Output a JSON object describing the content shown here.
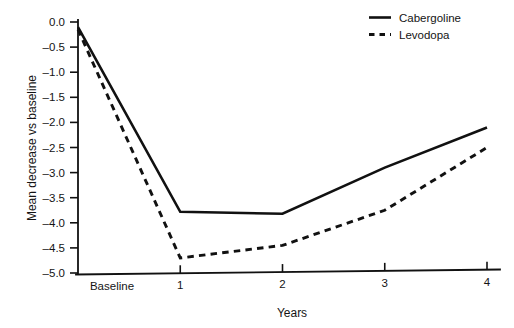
{
  "chart_data": {
    "type": "line",
    "title": "",
    "subtitle": "",
    "xlabel": "Years",
    "ylabel": "Mean decrease vs baseline",
    "categories": [
      "Baseline",
      "1",
      "2",
      "3",
      "4"
    ],
    "x": [
      0,
      1,
      2,
      3,
      4
    ],
    "xlim": [
      0,
      4
    ],
    "ylim": [
      -5.0,
      0.0
    ],
    "grid": false,
    "legend_position": "top-right",
    "yticks": [
      "0.0",
      "-0.5",
      "-1.0",
      "-1.5",
      "-2.0",
      "-2.5",
      "-3.0",
      "-3.5",
      "-4.0",
      "-4.5",
      "-5.0"
    ],
    "ytick_values": [
      0.0,
      -0.5,
      -1.0,
      -1.5,
      -2.0,
      -2.5,
      -3.0,
      -3.5,
      -4.0,
      -4.5,
      -5.0
    ],
    "xticks": [
      "Baseline",
      "1",
      "2",
      "3",
      "4"
    ],
    "series": [
      {
        "name": "Cabergoline",
        "style": "solid",
        "color": "#111111",
        "values": [
          -0.1,
          -3.78,
          -3.82,
          -2.9,
          -2.1
        ]
      },
      {
        "name": "Levodopa",
        "style": "dashed",
        "color": "#111111",
        "values": [
          -0.15,
          -4.7,
          -4.45,
          -3.75,
          -2.5
        ]
      }
    ]
  },
  "axes": {
    "y_title": "Mean decrease vs baseline",
    "x_title": "Years"
  },
  "legend": {
    "items": [
      {
        "label": "Cabergoline",
        "style": "solid"
      },
      {
        "label": "Levodopa",
        "style": "dashed"
      }
    ]
  }
}
